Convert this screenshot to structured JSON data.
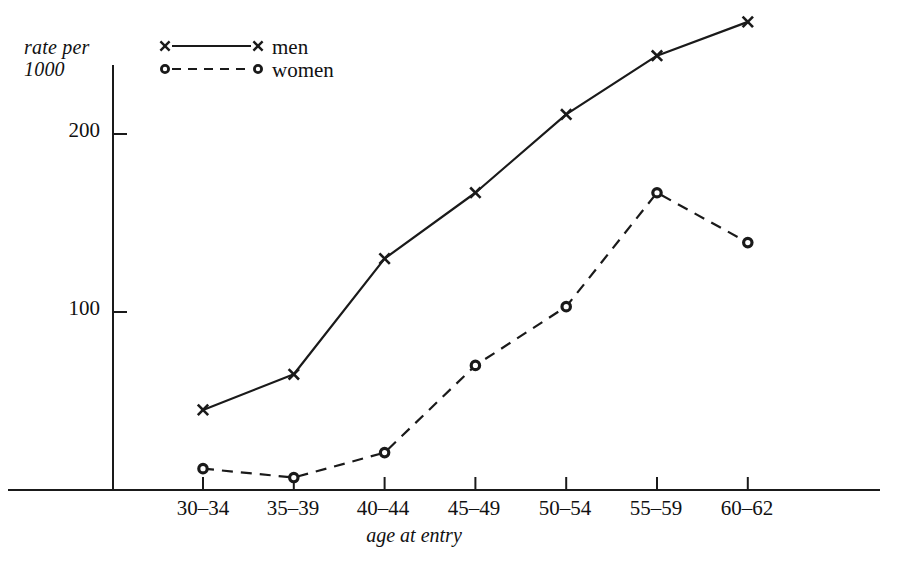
{
  "chart_data": {
    "type": "line",
    "title": "",
    "xlabel": "age at entry",
    "ylabel": "rate per\n1000",
    "categories": [
      "30–34",
      "35–39",
      "40–44",
      "45–49",
      "50–54",
      "55–59",
      "60–62"
    ],
    "yticks": [
      100,
      200
    ],
    "ylim": [
      0,
      275
    ],
    "grid": false,
    "legend_position": "top-left-inside",
    "series": [
      {
        "name": "men",
        "marker": "x",
        "line_style": "solid",
        "color": "#1a1a1a",
        "values": [
          45,
          65,
          130,
          167,
          211,
          244,
          263
        ]
      },
      {
        "name": "women",
        "marker": "o",
        "line_style": "dashed",
        "color": "#1a1a1a",
        "values": [
          12,
          7,
          21,
          70,
          103,
          167,
          139
        ]
      }
    ]
  },
  "axes": {
    "y_label_text": "rate per\n1000",
    "x_label_text": "age at entry",
    "y_tick_labels": [
      "200",
      "100"
    ],
    "x_tick_labels": [
      "30–34",
      "35–39",
      "40–44",
      "45–49",
      "50–54",
      "55–59",
      "60–62"
    ]
  },
  "legend": {
    "entries": [
      {
        "label": "men",
        "marker": "x",
        "line_style": "solid"
      },
      {
        "label": "women",
        "marker": "o",
        "line_style": "dashed"
      }
    ]
  },
  "colors": {
    "ink": "#1a1a1a",
    "background": "#ffffff"
  }
}
